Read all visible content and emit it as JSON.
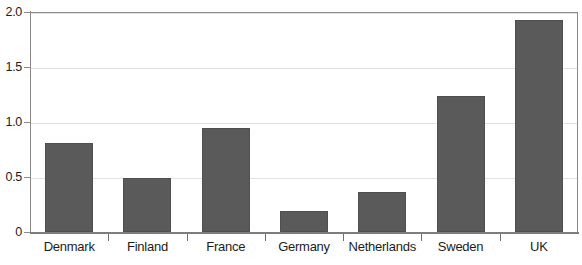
{
  "chart_data": {
    "type": "bar",
    "title": "",
    "subtitle": "",
    "xlabel": "",
    "ylabel": "",
    "categories": [
      "Denmark",
      "Finland",
      "France",
      "Germany",
      "Netherlands",
      "Sweden",
      "UK"
    ],
    "values": [
      0.81,
      0.49,
      0.95,
      0.19,
      0.36,
      1.24,
      1.93
    ],
    "ylim": [
      0,
      2.0
    ],
    "ytick_labels": [
      "0",
      "0.5",
      "1.0",
      "1.5",
      "2.0"
    ],
    "ytick_values": [
      0,
      0.5,
      1.0,
      1.5,
      2.0
    ],
    "grid": true,
    "legend": null,
    "bar_color": "#5a5a5a",
    "grid_color": "#e2e2e2",
    "axis_color": "#8a8a8a",
    "background_color": "#ffffff"
  }
}
